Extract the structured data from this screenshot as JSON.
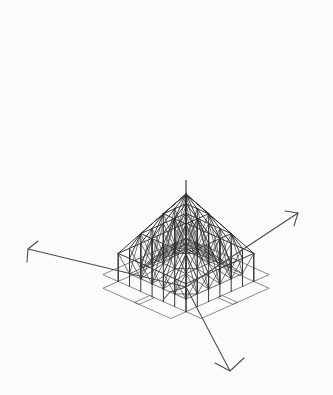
{
  "figure": {
    "kind": "engineering-line-drawing",
    "projection": "axonometric",
    "caption": "",
    "background_color": "#fbfbfa",
    "ink_color": "#3b3b3b",
    "width": 333,
    "height": 395
  },
  "ghost_text": {
    "note": "faint show-through from the reverse of the scanned page; not legible",
    "lines": [
      {
        "text": "· · ·  · ···· ···· · · · · ··",
        "x": 8,
        "y": 6
      },
      {
        "text": "······   ······· ·· · ··· · ·",
        "x": 14,
        "y": 22
      },
      {
        "text": "· ··· ··  · ·· ··· · ·· · ···",
        "x": 6,
        "y": 44
      },
      {
        "text": "·· · ···· · ·· ··· · · ··",
        "x": 20,
        "y": 66
      },
      {
        "text": "· ·· ··· ·· · ···· · ·· ·",
        "x": 10,
        "y": 132
      },
      {
        "text": "··· · ···· ·· ··· · ··· ··",
        "x": 16,
        "y": 158
      },
      {
        "text": "· · ··· ··· · ·· ··· · ·",
        "x": 8,
        "y": 186
      },
      {
        "text": "·· ··· · ··· · ···· · ··",
        "x": 22,
        "y": 212
      },
      {
        "text": "· ···· ·· · ··· ·· · ···",
        "x": 12,
        "y": 246
      },
      {
        "text": "··· · ·· ··· · ··· ·· ·",
        "x": 4,
        "y": 300
      },
      {
        "text": "· ·· · ···· · ·· ··· ··",
        "x": 18,
        "y": 340
      },
      {
        "text": "···· ··  · ··· · ·· ····",
        "x": 72,
        "y": 380
      }
    ]
  },
  "geometry": {
    "projection_basis": {
      "comment": "screen = origin + u*ex + v*ey + w*ez, axonometric",
      "origin": [
        186.0,
        287.0
      ],
      "ex": [
        11.3,
        5.05
      ],
      "ey": [
        -11.3,
        5.05
      ],
      "ez": [
        0.0,
        -5.6
      ]
    },
    "space_frame": {
      "top_layer": {
        "comment": "upper chord grid, nodes at integer (i,j), height falls off from apex",
        "half_span": 3,
        "apex_height": 16.6,
        "rim_height": 6.0,
        "profile": "pyramidal, linear in chebyshev radius"
      },
      "bottom_layer": {
        "comment": "lower chord grid offset by half a bay, hangs below top layer",
        "half_span": 3,
        "apex_height": 9.2,
        "rim_height": 1.0,
        "profile": "pyramidal, linear in chebyshev radius"
      },
      "bay_size": 1,
      "web_pattern": "each lower node braced to the four surrounding upper nodes",
      "cantilever_plates": [
        {
          "name": "north-west-flap",
          "corner": "NW"
        },
        {
          "name": "north-east-flap",
          "corner": "NE"
        },
        {
          "name": "south-west-flap",
          "corner": "SW"
        },
        {
          "name": "south-east-flap",
          "corner": "SE"
        }
      ]
    },
    "mast": {
      "name": "central-column",
      "top": [
        186.0,
        180.0
      ],
      "bottom": [
        186.0,
        287.0
      ]
    },
    "axis_triad": {
      "origin": [
        186.0,
        287.0
      ],
      "axes": [
        {
          "name": "axis-x-left",
          "label": "",
          "tip": [
            28.0,
            249.0
          ],
          "head": [
            [
              38.0,
              241.0
            ],
            [
              28.0,
              249.0
            ],
            [
              27.0,
              262.0
            ]
          ]
        },
        {
          "name": "axis-y-right",
          "label": "",
          "tip": [
            298.0,
            213.0
          ],
          "head": [
            [
              285.0,
              211.0
            ],
            [
              298.0,
              213.0
            ],
            [
              294.0,
              226.0
            ]
          ]
        },
        {
          "name": "axis-z-down",
          "label": "",
          "tip": [
            230.0,
            371.0
          ],
          "head": [
            [
              215.0,
              363.0
            ],
            [
              230.0,
              371.0
            ],
            [
              244.0,
              358.0
            ]
          ]
        }
      ],
      "base_tick": {
        "name": "ground-tick",
        "path": [
          [
            163.0,
            300.0
          ],
          [
            170.0,
            292.0
          ],
          [
            186.0,
            287.0
          ]
        ]
      }
    }
  }
}
